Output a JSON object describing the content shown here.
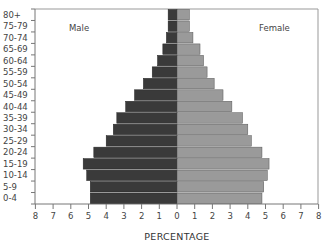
{
  "chart_data": {
    "type": "bar",
    "orientation": "horizontal",
    "subtype": "population-pyramid",
    "title": "",
    "xlabel": "PERCENTAGE",
    "ylabel": "",
    "categories": [
      "0-4",
      "5-9",
      "10-14",
      "15-19",
      "20-24",
      "25-29",
      "30-34",
      "35-39",
      "40-44",
      "45-49",
      "50-54",
      "55-59",
      "60-64",
      "65-69",
      "70-74",
      "75-79",
      "80+"
    ],
    "series": [
      {
        "name": "Male",
        "side": "left",
        "color": "#3a3a3a",
        "values": [
          4.9,
          4.9,
          5.1,
          5.3,
          4.7,
          4.0,
          3.6,
          3.4,
          2.9,
          2.4,
          1.9,
          1.4,
          1.1,
          0.8,
          0.6,
          0.5,
          0.5
        ]
      },
      {
        "name": "Female",
        "side": "right",
        "color": "#9a9a9a",
        "values": [
          4.8,
          4.9,
          5.1,
          5.2,
          4.8,
          4.2,
          4.0,
          3.7,
          3.1,
          2.6,
          2.1,
          1.7,
          1.5,
          1.3,
          0.9,
          0.7,
          0.7
        ]
      }
    ],
    "xlim": [
      -8,
      8
    ],
    "xticks": [
      8,
      7,
      6,
      5,
      4,
      3,
      2,
      1,
      0,
      1,
      2,
      3,
      4,
      5,
      6,
      7,
      8
    ],
    "grid": false,
    "legend": {
      "position": "inside-top",
      "entries": [
        "Male",
        "Female"
      ]
    }
  },
  "labels": {
    "male": "Male",
    "female": "Female",
    "x_title": "PERCENTAGE"
  }
}
